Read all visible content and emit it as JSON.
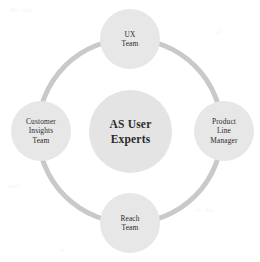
{
  "diagram": {
    "type": "hub-and-spoke-circle",
    "background_color": "#ffffff",
    "ring_color": "#c9c9c9",
    "node_fill_color": "#e7e7e7",
    "hub_fill_color": "#e4e4e4",
    "label_color": "#2b2b2b",
    "hub": {
      "label": "AS User\nExperts"
    },
    "nodes": [
      {
        "id": "ux",
        "label": "UX\nTeam",
        "position": "top"
      },
      {
        "id": "product",
        "label": "Product\nLine\nManager",
        "position": "right"
      },
      {
        "id": "reach",
        "label": "Reach\nTeam",
        "position": "bottom"
      },
      {
        "id": "customer",
        "label": "Customer\nInsights\nTeam",
        "position": "left"
      }
    ]
  },
  "artifacts": {
    "bleed_1": "the the",
    "bleed_2": "in a",
    "bleed_3": "of",
    "bleed_4": "and",
    "bleed_5": "to the",
    "bleed_6": "is"
  }
}
